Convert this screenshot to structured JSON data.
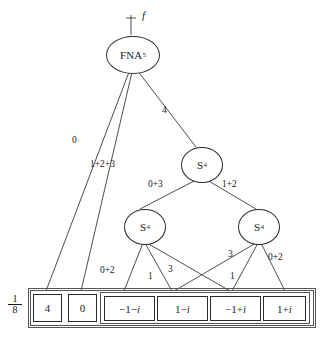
{
  "figure": {
    "type": "signal-flow-decomposition-tree",
    "input_label": "f",
    "scale_factor": {
      "numerator": "1",
      "denominator": "8"
    }
  },
  "nodes": [
    {
      "id": "root",
      "label": "FNA",
      "subscript": "5",
      "name": "fna-node"
    },
    {
      "id": "s4a",
      "label": "S",
      "subscript": "4",
      "name": "s4-node-level2"
    },
    {
      "id": "s4b",
      "label": "S",
      "subscript": "4",
      "name": "s4-node-left"
    },
    {
      "id": "s4c",
      "label": "S",
      "subscript": "4",
      "name": "s4-node-right"
    }
  ],
  "leaves": [
    {
      "id": "l1",
      "text": "4",
      "name": "leaf-4"
    },
    {
      "id": "l2",
      "text": "0",
      "name": "leaf-0"
    },
    {
      "id": "l3",
      "pre": "−1−",
      "it": "i",
      "text": "−1−i",
      "name": "leaf-minus1-minus-i"
    },
    {
      "id": "l4",
      "pre": "1−",
      "it": "i",
      "text": "1−i",
      "name": "leaf-1-minus-i"
    },
    {
      "id": "l5",
      "pre": "−1+",
      "it": "i",
      "text": "−1+i",
      "name": "leaf-minus1-plus-i"
    },
    {
      "id": "l6",
      "pre": "1+",
      "it": "i",
      "text": "1+i",
      "name": "leaf-1-plus-i"
    }
  ],
  "edge_labels": [
    {
      "id": "e0",
      "text": "0",
      "name": "edge-label-0"
    },
    {
      "id": "e123",
      "text": "1+2+3",
      "name": "edge-label-1-2-3"
    },
    {
      "id": "e4",
      "text": "4",
      "name": "edge-label-4"
    },
    {
      "id": "e03",
      "text": "0+3",
      "name": "edge-label-0-3"
    },
    {
      "id": "e12",
      "text": "1+2",
      "name": "edge-label-1-2"
    },
    {
      "id": "e02L",
      "text": "0+2",
      "name": "edge-label-0-2-left"
    },
    {
      "id": "e1L",
      "text": "1",
      "name": "edge-label-1-left"
    },
    {
      "id": "e3L",
      "text": "3",
      "name": "edge-label-3-left"
    },
    {
      "id": "e3R",
      "text": "3",
      "name": "edge-label-3-right"
    },
    {
      "id": "e1R",
      "text": "1",
      "name": "edge-label-1-right"
    },
    {
      "id": "e02R",
      "text": "0+2",
      "name": "edge-label-0-2-right"
    }
  ]
}
